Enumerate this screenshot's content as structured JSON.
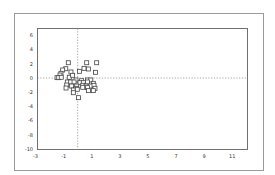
{
  "chart_data": {
    "type": "scatter",
    "title": "",
    "xlabel": "",
    "ylabel": "",
    "xlim": [
      -3,
      12.5
    ],
    "ylim": [
      -10,
      7
    ],
    "x_ticks": [
      -3,
      -1,
      1,
      3,
      5,
      7,
      9,
      11
    ],
    "x_tick_labels": [
      "-3",
      "-1",
      "1",
      "3",
      "5",
      "7",
      "9",
      "11"
    ],
    "y_ticks": [
      6,
      4,
      2,
      0,
      -2,
      -4,
      -6,
      -8,
      -10
    ],
    "y_tick_labels": [
      "6",
      "4",
      "2",
      "0",
      "-2",
      "-4",
      "-6",
      "-8",
      "-10"
    ],
    "grid": false,
    "reference_lines": {
      "x": 0,
      "y": 0,
      "style": "dotted"
    },
    "marker": "open-square",
    "legend": null,
    "series": [
      {
        "name": "points",
        "x": [
          -0.67,
          0.64,
          1.35,
          -0.85,
          0.45,
          0.76,
          -1.07,
          -1.19,
          -0.48,
          0.12,
          1.26,
          -1.26,
          -1.47,
          -1.35,
          -1.17,
          -0.6,
          -0.36,
          -0.12,
          0.28,
          0.69,
          0.93,
          -0.74,
          -0.5,
          -0.26,
          0.16,
          0.4,
          0.69,
          1.11,
          -0.78,
          -0.43,
          -0.07,
          0.36,
          0.59,
          0.93,
          1.16,
          -0.83,
          -0.12,
          0.36,
          0.69,
          1.23,
          -0.31,
          -0.03,
          0.76,
          1.11,
          -0.31,
          0.05
        ],
        "y": [
          2.15,
          2.15,
          2.15,
          1.31,
          1.36,
          1.27,
          1.13,
          0.66,
          0.85,
          0.94,
          0.8,
          0.42,
          0.05,
          0.05,
          0.1,
          0.1,
          0.38,
          -0.28,
          -0.38,
          -0.28,
          -0.28,
          -0.56,
          -0.56,
          -0.56,
          -0.66,
          -0.66,
          -0.56,
          -0.75,
          -0.99,
          -1.13,
          -1.13,
          -1.03,
          -1.13,
          -1.13,
          -1.03,
          -1.41,
          -1.45,
          -1.31,
          -1.36,
          -1.45,
          -1.69,
          -1.59,
          -1.78,
          -1.78,
          -2.07,
          -2.77
        ]
      }
    ]
  }
}
